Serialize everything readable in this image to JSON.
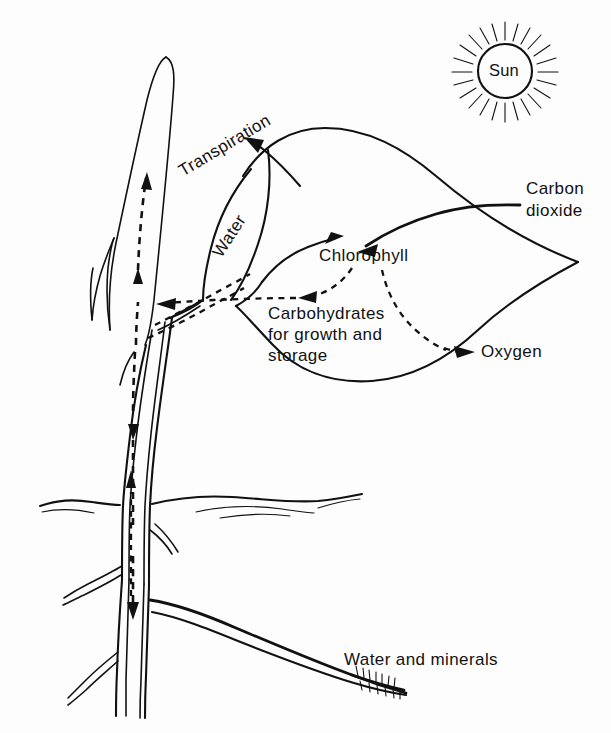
{
  "figure": {
    "type": "diagram",
    "background_color": "#fdfdfd",
    "ink_color": "#111111"
  },
  "labels": {
    "sun": "Sun",
    "transpiration": "Transpiration",
    "water": "Water",
    "carbon_dioxide_line1": "Carbon",
    "carbon_dioxide_line2": "dioxide",
    "chlorophyll": "Chlorophyll",
    "carbohydrates_line1": "Carbohydrates",
    "carbohydrates_line2": "for growth and",
    "carbohydrates_line3": "storage",
    "oxygen": "Oxygen",
    "water_and_minerals": "Water and minerals"
  },
  "elements": {
    "sun_name": "sun-symbol",
    "leaf_large_name": "large-leaf-outline",
    "leaf_narrow_name": "narrow-upright-leaf",
    "stem_name": "plant-stem",
    "ground_name": "ground-line",
    "roots_name": "root-system",
    "lateral_root_name": "lateral-root",
    "root_hairs_name": "root-hairs"
  },
  "flows": {
    "transpiration_arrow": "solid-arrow-up-left",
    "carbon_dioxide_arrow": "solid-arrow-into-leaf",
    "water_to_chlorophyll_arrow": "solid-arrow-right",
    "chlorophyll_to_carbohydrates": "dashed-arrow-left",
    "chlorophyll_to_oxygen": "dashed-arrow-down-right",
    "xylem_up": "dashed-arrow-up",
    "phloem_down": "dashed-arrow-down",
    "uptake_up": "dashed-arrow-up-from-root"
  }
}
